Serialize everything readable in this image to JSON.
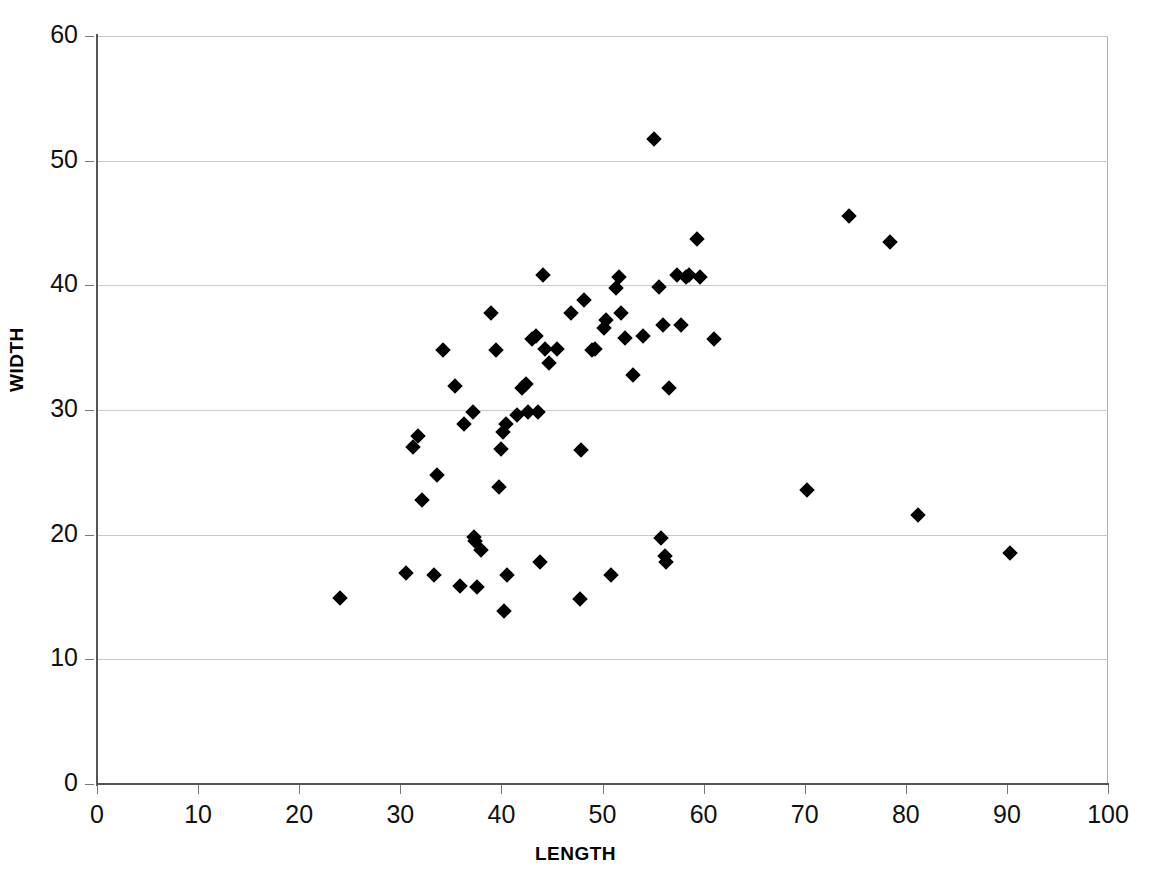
{
  "chart_data": {
    "type": "scatter",
    "title": "",
    "xlabel": "LENGTH",
    "ylabel": "WIDTH",
    "xlim": [
      0,
      100
    ],
    "ylim": [
      0,
      60
    ],
    "xticks": [
      0,
      10,
      20,
      30,
      40,
      50,
      60,
      70,
      80,
      90,
      100
    ],
    "yticks": [
      0,
      10,
      20,
      30,
      40,
      50,
      60
    ],
    "grid": "horizontal",
    "legend": "none",
    "marker": "diamond",
    "marker_color": "#000000",
    "series": [
      {
        "name": "observations",
        "points": [
          [
            24.0,
            14.9
          ],
          [
            30.6,
            16.9
          ],
          [
            31.3,
            27.0
          ],
          [
            31.8,
            27.9
          ],
          [
            32.1,
            22.8
          ],
          [
            33.3,
            16.8
          ],
          [
            33.6,
            24.8
          ],
          [
            34.2,
            34.8
          ],
          [
            35.4,
            31.9
          ],
          [
            35.9,
            15.9
          ],
          [
            36.3,
            28.9
          ],
          [
            37.2,
            29.8
          ],
          [
            37.3,
            19.8
          ],
          [
            37.4,
            19.5
          ],
          [
            37.6,
            15.8
          ],
          [
            38.0,
            18.8
          ],
          [
            39.0,
            37.8
          ],
          [
            39.5,
            34.8
          ],
          [
            39.8,
            23.8
          ],
          [
            40.0,
            26.9
          ],
          [
            40.2,
            28.2
          ],
          [
            40.3,
            13.9
          ],
          [
            40.5,
            28.9
          ],
          [
            40.6,
            16.8
          ],
          [
            41.5,
            29.6
          ],
          [
            42.0,
            31.8
          ],
          [
            42.4,
            32.1
          ],
          [
            42.6,
            29.8
          ],
          [
            43.0,
            35.7
          ],
          [
            43.4,
            35.9
          ],
          [
            43.6,
            29.8
          ],
          [
            43.8,
            17.8
          ],
          [
            44.1,
            40.8
          ],
          [
            44.3,
            34.9
          ],
          [
            44.7,
            33.8
          ],
          [
            45.5,
            34.9
          ],
          [
            46.9,
            37.8
          ],
          [
            47.8,
            14.8
          ],
          [
            47.9,
            26.8
          ],
          [
            48.2,
            38.8
          ],
          [
            49.0,
            34.8
          ],
          [
            49.3,
            34.9
          ],
          [
            50.1,
            36.6
          ],
          [
            50.3,
            37.2
          ],
          [
            50.8,
            16.8
          ],
          [
            51.3,
            39.8
          ],
          [
            51.6,
            40.7
          ],
          [
            51.8,
            37.8
          ],
          [
            52.2,
            35.8
          ],
          [
            53.0,
            32.8
          ],
          [
            54.0,
            35.9
          ],
          [
            55.1,
            51.7
          ],
          [
            55.6,
            39.9
          ],
          [
            55.8,
            19.7
          ],
          [
            56.0,
            36.8
          ],
          [
            56.2,
            18.3
          ],
          [
            56.3,
            17.8
          ],
          [
            56.6,
            31.8
          ],
          [
            57.4,
            40.8
          ],
          [
            57.8,
            36.8
          ],
          [
            58.3,
            40.7
          ],
          [
            58.6,
            40.8
          ],
          [
            59.3,
            43.7
          ],
          [
            59.6,
            40.7
          ],
          [
            61.0,
            35.7
          ],
          [
            70.2,
            23.6
          ],
          [
            74.4,
            45.6
          ],
          [
            78.4,
            43.5
          ],
          [
            81.2,
            21.6
          ],
          [
            90.3,
            18.5
          ]
        ]
      }
    ]
  },
  "axes": {
    "x": {
      "label": "LENGTH",
      "tick_labels": [
        "0",
        "10",
        "20",
        "30",
        "40",
        "50",
        "60",
        "70",
        "80",
        "90",
        "100"
      ]
    },
    "y": {
      "label": "WIDTH",
      "tick_labels": [
        "0",
        "10",
        "20",
        "30",
        "40",
        "50",
        "60"
      ]
    }
  },
  "colors": {
    "marker": "#000000",
    "gridline": "#c8c8c8",
    "axis": "#555555",
    "frame": "#b0b0b0",
    "background": "#ffffff",
    "text": "#111111"
  }
}
